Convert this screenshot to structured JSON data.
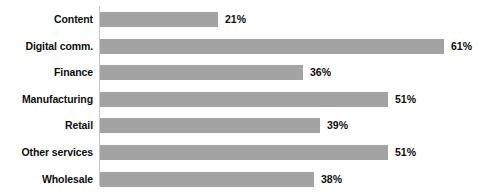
{
  "chart_data": {
    "type": "bar",
    "orientation": "horizontal",
    "title": "",
    "subtitle": "",
    "xlabel": "",
    "ylabel": "",
    "grid": false,
    "legend": null,
    "xlim": [
      0,
      65
    ],
    "axis_line": true,
    "bar_color": "#a3a3a3",
    "label_color": "#0d0d0d",
    "value_suffix": "%",
    "categories": [
      "Content",
      "Digital comm.",
      "Finance",
      "Manufacturing",
      "Retail",
      "Other services",
      "Wholesale"
    ],
    "values": [
      21,
      61,
      36,
      51,
      39,
      51,
      38
    ],
    "value_labels": [
      "21%",
      "61%",
      "36%",
      "51%",
      "39%",
      "51%",
      "38%"
    ]
  }
}
